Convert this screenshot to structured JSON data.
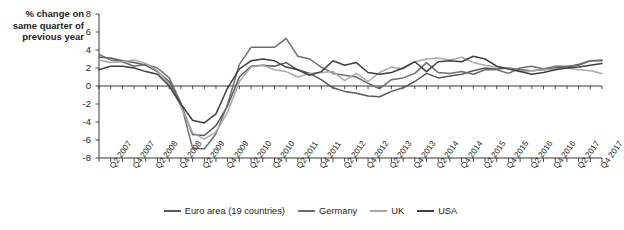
{
  "chart_data": {
    "type": "line",
    "title": "",
    "ylabel": "% change on same quarter of previous year",
    "xlabel": "",
    "ylim": [
      -8,
      8
    ],
    "yticks": [
      -8,
      -6,
      -4,
      -2,
      0,
      2,
      4,
      6,
      8
    ],
    "grid": false,
    "legend_position": "bottom-center",
    "x": [
      "Q1 2007",
      "Q2 2007",
      "Q3 2007",
      "Q4 2007",
      "Q1 2008",
      "Q2 2008",
      "Q3 2008",
      "Q4 2008",
      "Q1 2009",
      "Q2 2009",
      "Q3 2009",
      "Q4 2009",
      "Q1 2010",
      "Q2 2010",
      "Q3 2010",
      "Q4 2010",
      "Q1 2011",
      "Q2 2011",
      "Q3 2011",
      "Q4 2011",
      "Q1 2012",
      "Q2 2012",
      "Q3 2012",
      "Q4 2012",
      "Q1 2013",
      "Q2 2013",
      "Q3 2013",
      "Q4 2013",
      "Q1 2014",
      "Q2 2014",
      "Q3 2014",
      "Q4 2014",
      "Q1 2015",
      "Q2 2015",
      "Q3 2015",
      "Q4 2015",
      "Q1 2016",
      "Q2 2016",
      "Q3 2016",
      "Q4 2016",
      "Q1 2017",
      "Q2 2017",
      "Q3 2017",
      "Q4 2017"
    ],
    "xtick_labels": [
      "Q2 2007",
      "Q4 2007",
      "Q2 2008",
      "Q4 2008",
      "Q2 2009",
      "Q4 2009",
      "Q2 2010",
      "Q4 2010",
      "Q2 2011",
      "Q4 2011",
      "Q2 2012",
      "Q4 2012",
      "Q2 2013",
      "Q4 2013",
      "Q2 2014",
      "Q4 2014",
      "Q2 2015",
      "Q4 2015",
      "Q2 2016",
      "Q4 2016",
      "Q2 2017",
      "Q4 2017"
    ],
    "xtick_label_indices": [
      1,
      3,
      5,
      7,
      9,
      11,
      13,
      15,
      17,
      19,
      21,
      23,
      25,
      27,
      29,
      31,
      33,
      35,
      37,
      39,
      41,
      43
    ],
    "series": [
      {
        "name": "Euro area (19 countries)",
        "color": "#58585b",
        "width": 1.5,
        "values": [
          3.2,
          3.1,
          2.8,
          2.6,
          2.3,
          1.6,
          0.5,
          -2.0,
          -5.4,
          -5.5,
          -4.4,
          -2.2,
          1.0,
          2.2,
          2.3,
          2.2,
          2.6,
          1.8,
          1.4,
          0.7,
          -0.2,
          -0.6,
          -0.8,
          -1.1,
          -1.2,
          -0.6,
          -0.2,
          0.5,
          1.4,
          0.9,
          1.1,
          1.3,
          1.7,
          2.0,
          1.9,
          2.0,
          1.8,
          1.7,
          1.8,
          2.0,
          2.1,
          2.4,
          2.8,
          2.8
        ]
      },
      {
        "name": "Germany",
        "color": "#6d6e71",
        "width": 1.5,
        "values": [
          3.5,
          2.9,
          2.7,
          2.2,
          2.4,
          2.0,
          0.9,
          -1.9,
          -6.9,
          -7.0,
          -5.3,
          -2.0,
          2.4,
          4.3,
          4.3,
          4.3,
          5.3,
          3.3,
          3.0,
          2.1,
          1.4,
          1.2,
          1.0,
          0.3,
          -0.3,
          0.7,
          0.9,
          1.4,
          2.6,
          1.5,
          1.4,
          1.6,
          1.3,
          1.8,
          1.8,
          1.4,
          2.0,
          2.2,
          1.9,
          2.2,
          2.2,
          2.3,
          2.8,
          2.9
        ]
      },
      {
        "name": "UK",
        "color": "#a7a9ac",
        "width": 1.5,
        "values": [
          2.9,
          2.6,
          2.7,
          2.9,
          2.5,
          1.7,
          0.2,
          -2.3,
          -5.2,
          -5.9,
          -5.1,
          -2.9,
          0.5,
          2.1,
          2.3,
          1.8,
          1.6,
          1.0,
          1.4,
          1.5,
          1.6,
          0.6,
          1.4,
          0.5,
          1.5,
          2.1,
          1.9,
          2.7,
          3.0,
          3.1,
          2.9,
          3.2,
          2.6,
          2.3,
          2.1,
          2.0,
          1.6,
          1.7,
          1.8,
          1.9,
          2.0,
          1.8,
          1.7,
          1.4
        ]
      },
      {
        "name": "USA",
        "color": "#3f3f41",
        "width": 1.5,
        "values": [
          1.8,
          2.2,
          2.2,
          2.0,
          1.6,
          1.3,
          0.0,
          -2.0,
          -3.8,
          -4.1,
          -3.1,
          -0.2,
          1.9,
          2.8,
          3.0,
          2.8,
          2.1,
          1.8,
          1.2,
          1.6,
          2.8,
          2.3,
          2.6,
          1.5,
          1.3,
          1.5,
          2.0,
          2.7,
          1.6,
          2.7,
          2.8,
          2.7,
          3.3,
          3.0,
          2.2,
          1.9,
          1.6,
          1.3,
          1.5,
          1.8,
          2.0,
          2.1,
          2.3,
          2.5
        ]
      }
    ]
  },
  "legend": {
    "items": [
      {
        "label": "Euro area (19 countries)",
        "color": "#58585b"
      },
      {
        "label": "Germany",
        "color": "#6d6e71"
      },
      {
        "label": "UK",
        "color": "#a7a9ac"
      },
      {
        "label": "USA",
        "color": "#3f3f41"
      }
    ]
  }
}
